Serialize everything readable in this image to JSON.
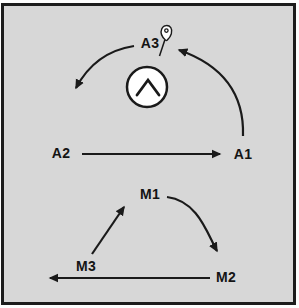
{
  "diagram": {
    "background_color": "#d7d7d7",
    "border_color": "#1c1c1c",
    "line_color": "#1a1a1a",
    "nodes": {
      "a3": {
        "label": "A3"
      },
      "a2": {
        "label": "A2"
      },
      "a1": {
        "label": "A1"
      },
      "m1": {
        "label": "M1"
      },
      "m2": {
        "label": "M2"
      },
      "m3": {
        "label": "M3"
      }
    },
    "icons": {
      "center_icon": "circle-chevron-icon",
      "a3_marker": "pin-icon"
    },
    "edges": [
      {
        "from": "A2",
        "to": "A1",
        "style": "straight"
      },
      {
        "from": "A1",
        "to": "A3",
        "style": "curved"
      },
      {
        "from": "A3",
        "to": "A2",
        "style": "curved"
      },
      {
        "from": "M3",
        "to": "M1",
        "style": "straight"
      },
      {
        "from": "M1",
        "to": "M2",
        "style": "curved"
      },
      {
        "from": "M2",
        "to": "M3",
        "style": "straight"
      }
    ]
  }
}
